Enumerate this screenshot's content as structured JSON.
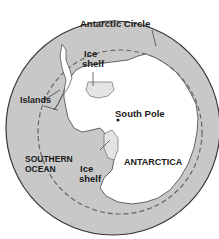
{
  "map": {
    "title": "Antarctica",
    "colors": {
      "ocean": "#c8c8c8",
      "land": "#ffffff",
      "ice_shelf": "#e4e4e4",
      "outline": "#333333",
      "circle_line": "#666666"
    },
    "labels": {
      "antarctic_circle": "Antarctic Circle",
      "ice_shelf_top_line1": "Ice",
      "ice_shelf_top_line2": "shelf",
      "islands": "Islands",
      "south_pole": "South Pole",
      "southern_ocean_line1": "SOUTHERN",
      "southern_ocean_line2": "OCEAN",
      "ice_shelf_bottom_line1": "Ice",
      "ice_shelf_bottom_line2": "shelf",
      "antarctica": "ANTARCTICA"
    }
  }
}
